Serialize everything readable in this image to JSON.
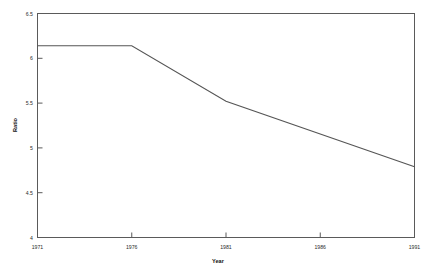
{
  "chart_data": {
    "type": "line",
    "title": "",
    "xlabel": "Year",
    "ylabel": "Ratio",
    "x": [
      1971,
      1976,
      1981,
      1991
    ],
    "values": [
      6.14,
      6.14,
      5.52,
      4.79
    ],
    "series": [
      {
        "name": "Ratio",
        "x": [
          1971,
          1976,
          1981,
          1991
        ],
        "values": [
          6.14,
          6.14,
          5.52,
          4.79
        ]
      }
    ],
    "xlim": [
      1971,
      1991
    ],
    "ylim": [
      4,
      6.5
    ],
    "xticks": [
      1971,
      1976,
      1981,
      1986,
      1991
    ],
    "xtick_labels": [
      "1971",
      "1976",
      "1981",
      "1986",
      "1991"
    ],
    "yticks": [
      4,
      4.5,
      5,
      5.5,
      6,
      6.5
    ],
    "ytick_labels": [
      "4",
      "4.5",
      "5",
      "5.5",
      "6",
      "6.5"
    ],
    "grid": false,
    "legend": "none",
    "line_color": "#555555",
    "background_color": "#ffffff",
    "axis_color": "#5a5a5a"
  },
  "axes": {
    "x_title": "Year",
    "y_title": "Ratio"
  },
  "x_ticks": [
    {
      "label": "1971"
    },
    {
      "label": "1976"
    },
    {
      "label": "1981"
    },
    {
      "label": "1986"
    },
    {
      "label": "1991"
    }
  ],
  "y_ticks": [
    {
      "label": "6.5"
    },
    {
      "label": "6"
    },
    {
      "label": "5.5"
    },
    {
      "label": "5"
    },
    {
      "label": "4.5"
    },
    {
      "label": "4"
    }
  ]
}
